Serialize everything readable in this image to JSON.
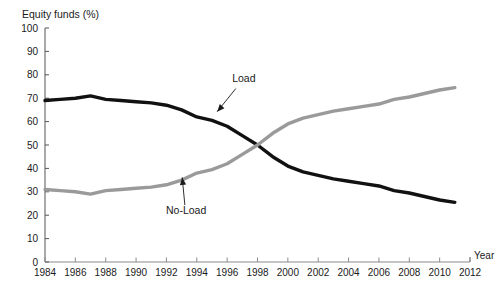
{
  "chart_data": {
    "type": "line",
    "title": "",
    "ylabel": "Equity funds (%)",
    "xlabel": "Year",
    "xlim": [
      1984,
      2012
    ],
    "ylim": [
      0,
      100
    ],
    "ytick_step": 10,
    "xtick_step": 2,
    "grid": false,
    "legend": "inline-annotations",
    "yticks": [
      "0",
      "10",
      "20",
      "30",
      "40",
      "50",
      "60",
      "70",
      "80",
      "90",
      "100"
    ],
    "xticks": [
      "1984",
      "1986",
      "1988",
      "1990",
      "1992",
      "1994",
      "1996",
      "1998",
      "2000",
      "2002",
      "2004",
      "2006",
      "2008",
      "2010",
      "2012"
    ],
    "x": [
      1984,
      1985,
      1986,
      1987,
      1988,
      1989,
      1990,
      1991,
      1992,
      1993,
      1994,
      1995,
      1996,
      1997,
      1998,
      1999,
      2000,
      2001,
      2002,
      2003,
      2004,
      2005,
      2006,
      2007,
      2008,
      2009,
      2010,
      2011
    ],
    "series": [
      {
        "name": "Load",
        "color": "#111111",
        "values": [
          69,
          69.5,
          70,
          71,
          69.5,
          69,
          68.5,
          68,
          67,
          65,
          62,
          60.5,
          58,
          54,
          50,
          45,
          41,
          38.5,
          37,
          35.5,
          34.5,
          33.5,
          32.5,
          30.5,
          29.5,
          28,
          26.5,
          25.5
        ]
      },
      {
        "name": "No-Load",
        "color": "#9a9a9a",
        "values": [
          31,
          30.5,
          30,
          29,
          30.5,
          31,
          31.5,
          32,
          33,
          35,
          38,
          39.5,
          42,
          46,
          50,
          55,
          59,
          61.5,
          63,
          64.5,
          65.5,
          66.5,
          67.5,
          69.5,
          70.5,
          72,
          73.5,
          74.5
        ]
      }
    ],
    "annotations": [
      {
        "text": "Load",
        "x": 1997.1,
        "y": 77,
        "arrow_to_x": 1995.1,
        "arrow_to_y": 62.5
      },
      {
        "text": "No-Load",
        "x": 1993.3,
        "y": 20.5,
        "arrow_to_x": 1993.0,
        "arrow_to_y": 38.5
      }
    ]
  }
}
